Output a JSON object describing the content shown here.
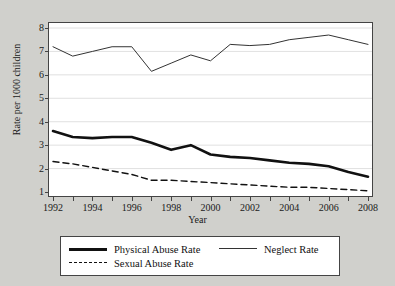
{
  "chart_data": {
    "type": "line",
    "title": "",
    "xlabel": "Year",
    "ylabel": "Rate per 1000 children",
    "xlim": [
      1992,
      2008
    ],
    "ylim": [
      1,
      8
    ],
    "grid": true,
    "legend_position": "bottom",
    "x": [
      1992,
      1993,
      1994,
      1995,
      1996,
      1997,
      1998,
      1999,
      2000,
      2001,
      2002,
      2003,
      2004,
      2005,
      2006,
      2007,
      2008
    ],
    "series": [
      {
        "name": "Physical Abuse Rate",
        "style": "thick-solid",
        "color": "#111111",
        "values": [
          3.6,
          3.35,
          3.3,
          3.35,
          3.35,
          3.1,
          2.8,
          3.0,
          2.6,
          2.5,
          2.45,
          2.35,
          2.25,
          2.2,
          2.1,
          1.85,
          1.65
        ]
      },
      {
        "name": "Neglect Rate",
        "style": "thin-solid",
        "color": "#333333",
        "values": [
          7.2,
          6.8,
          7.0,
          7.2,
          7.2,
          6.15,
          6.5,
          6.85,
          6.6,
          7.3,
          7.25,
          7.3,
          7.5,
          7.6,
          7.7,
          7.5,
          7.3
        ]
      },
      {
        "name": "Sexual Abuse Rate",
        "style": "dashed",
        "color": "#111111",
        "values": [
          2.3,
          2.2,
          2.05,
          1.9,
          1.75,
          1.5,
          1.5,
          1.45,
          1.4,
          1.35,
          1.3,
          1.25,
          1.2,
          1.2,
          1.15,
          1.1,
          1.05
        ]
      }
    ],
    "y_ticks": [
      1,
      2,
      3,
      4,
      5,
      6,
      7,
      8
    ],
    "x_ticks": [
      1992,
      1993,
      1994,
      1995,
      1996,
      1997,
      1998,
      1999,
      2000,
      2001,
      2002,
      2003,
      2004,
      2005,
      2006,
      2007,
      2008
    ],
    "x_tick_labels": [
      1992,
      1994,
      1996,
      1998,
      2000,
      2002,
      2004,
      2006,
      2008
    ]
  },
  "legend": {
    "items": [
      {
        "label": "Physical Abuse Rate"
      },
      {
        "label": "Neglect Rate"
      },
      {
        "label": "Sexual Abuse Rate"
      }
    ]
  }
}
